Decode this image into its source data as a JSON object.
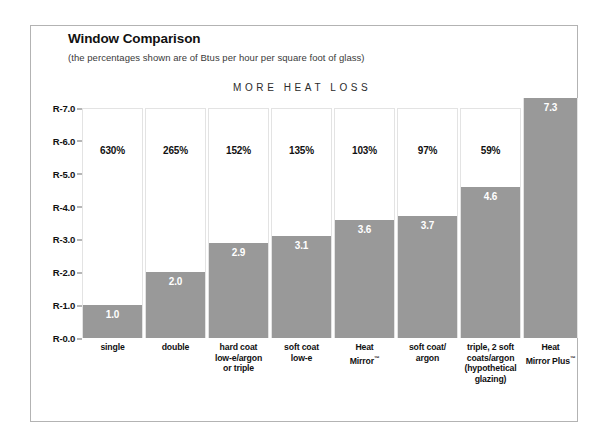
{
  "title": "Window Comparison",
  "subtitle": "(the percentages shown are of Btus per hour per square foot of glass)",
  "axis_annotation": "MORE HEAT LOSS",
  "colors": {
    "bar_fill": "#999999",
    "bar_outline": "#e3e3e3",
    "frame": "#b3b3b3",
    "text": "#111111",
    "background": "#ffffff"
  },
  "chart_data": {
    "type": "bar",
    "title": "Window Comparison",
    "subtitle": "(the percentages shown are of Btus per hour per square foot of glass)",
    "annotation": "MORE HEAT LOSS",
    "xlabel": "",
    "ylabel": "",
    "ylim": [
      0,
      7.0
    ],
    "grid": false,
    "legend": "none",
    "ytick_labels": [
      "R-7.0",
      "R-6.0",
      "R-5.0",
      "R-4.0",
      "R-3.0",
      "R-2.0",
      "R-1.0",
      "R-0.0"
    ],
    "ytick_values": [
      7.0,
      6.0,
      5.0,
      4.0,
      3.0,
      2.0,
      1.0,
      0.0
    ],
    "categories": [
      "single",
      "double",
      "hard coat low-e/argon or triple",
      "soft coat low-e",
      "Heat Mirror™",
      "soft coat/ argon",
      "triple, 2 soft coats/argon (hypothetical glazing)",
      "Heat Mirror Plus™"
    ],
    "values": [
      1.0,
      2.0,
      2.9,
      3.1,
      3.6,
      3.7,
      4.6,
      7.3
    ],
    "value_labels": [
      "1.0",
      "2.0",
      "2.9",
      "3.1",
      "3.6",
      "3.7",
      "4.6",
      "7.3"
    ],
    "percent_labels": [
      "630%",
      "265%",
      "152%",
      "135%",
      "103%",
      "97%",
      "59%",
      ""
    ],
    "percent_values": [
      630,
      265,
      152,
      135,
      103,
      97,
      59,
      null
    ]
  },
  "bars": [
    {
      "category_lines": [
        "single"
      ],
      "value_label": "1.0",
      "percent_label": "630%",
      "value": 1.0,
      "left": 0,
      "width": 61,
      "height": 230,
      "fill_height": 33
    },
    {
      "category_lines": [
        "double"
      ],
      "value_label": "2.0",
      "percent_label": "265%",
      "value": 2.0,
      "left": 63,
      "width": 61,
      "height": 230,
      "fill_height": 66
    },
    {
      "category_lines": [
        "hard coat",
        "low-e/argon",
        "or triple"
      ],
      "value_label": "2.9",
      "percent_label": "152%",
      "value": 2.9,
      "left": 126,
      "width": 61,
      "height": 230,
      "fill_height": 95
    },
    {
      "category_lines": [
        "soft coat",
        "low-e"
      ],
      "value_label": "3.1",
      "percent_label": "135%",
      "value": 3.1,
      "left": 189,
      "width": 61,
      "height": 230,
      "fill_height": 102
    },
    {
      "category_lines": [
        "Heat",
        "Mirror™"
      ],
      "value_label": "3.6",
      "percent_label": "103%",
      "value": 3.6,
      "left": 252,
      "width": 61,
      "height": 230,
      "fill_height": 118
    },
    {
      "category_lines": [
        "soft coat/",
        "argon"
      ],
      "value_label": "3.7",
      "percent_label": "97%",
      "value": 3.7,
      "left": 315,
      "width": 61,
      "height": 230,
      "fill_height": 122
    },
    {
      "category_lines": [
        "triple, 2 soft",
        "coats/argon",
        "(hypothetical",
        "glazing)"
      ],
      "value_label": "4.6",
      "percent_label": "59%",
      "value": 4.6,
      "left": 378,
      "width": 61,
      "height": 230,
      "fill_height": 151
    },
    {
      "category_lines": [
        "Heat",
        "Mirror Plus™"
      ],
      "value_label": "7.3",
      "percent_label": "",
      "value": 7.3,
      "left": 441,
      "width": 55,
      "height": 240,
      "fill_height": 240
    }
  ]
}
